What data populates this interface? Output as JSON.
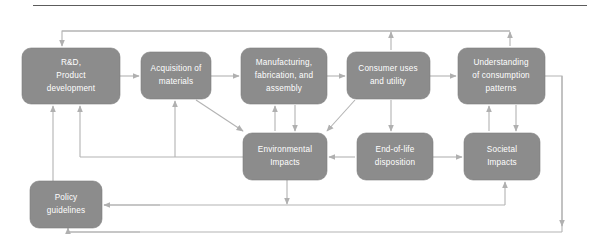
{
  "figure": {
    "type": "flow-diagram",
    "title": "",
    "top_rule": true,
    "palette": {
      "node_fill": "#8c8c8c",
      "node_text": "#ffffff",
      "edge": "#b3b3b3",
      "rule": "#5c5c5c",
      "background": "#ffffff"
    },
    "nodes": [
      {
        "id": "rd",
        "name": "rd-product-development",
        "lines": [
          "R&D,",
          "Product",
          "development"
        ],
        "x": 22,
        "y": 48,
        "w": 98,
        "h": 56
      },
      {
        "id": "acquisition",
        "name": "acquisition-of-materials",
        "lines": [
          "Acquisition of",
          "materials"
        ],
        "x": 141,
        "y": 52,
        "w": 70,
        "h": 47
      },
      {
        "id": "manufacturing",
        "name": "manufacturing-fabrication-assembly",
        "lines": [
          "Manufacturing,",
          "fabrication, and",
          "assembly"
        ],
        "x": 241,
        "y": 48,
        "w": 86,
        "h": 56
      },
      {
        "id": "consumer",
        "name": "consumer-uses-and-utility",
        "lines": [
          "Consumer uses",
          "and utility"
        ],
        "x": 347,
        "y": 52,
        "w": 83,
        "h": 47
      },
      {
        "id": "understanding",
        "name": "understanding-of-consumption-patterns",
        "lines": [
          "Understanding",
          "of consumption",
          "patterns"
        ],
        "x": 458,
        "y": 48,
        "w": 87,
        "h": 56
      },
      {
        "id": "environmental",
        "name": "environmental-impacts",
        "lines": [
          "Environmental",
          "Impacts"
        ],
        "x": 243,
        "y": 133,
        "w": 84,
        "h": 47
      },
      {
        "id": "endoflife",
        "name": "end-of-life-disposition",
        "lines": [
          "End-of-life",
          "disposition"
        ],
        "x": 357,
        "y": 133,
        "w": 76,
        "h": 47
      },
      {
        "id": "societal",
        "name": "societal-impacts",
        "lines": [
          "Societal",
          "Impacts"
        ],
        "x": 464,
        "y": 133,
        "w": 76,
        "h": 47
      },
      {
        "id": "policy",
        "name": "policy-guidelines",
        "lines": [
          "Policy",
          "guidelines"
        ],
        "x": 30,
        "y": 181,
        "w": 72,
        "h": 47
      }
    ],
    "edges": [
      {
        "name": "edge-rd-to-acquisition",
        "from": "rd",
        "to": "acquisition"
      },
      {
        "name": "edge-acquisition-to-manufacturing",
        "from": "acquisition",
        "to": "manufacturing"
      },
      {
        "name": "edge-manufacturing-to-consumer",
        "from": "manufacturing",
        "to": "consumer"
      },
      {
        "name": "edge-consumer-to-understanding",
        "from": "consumer",
        "to": "understanding"
      },
      {
        "name": "edge-acquisition-to-environmental",
        "from": "acquisition",
        "to": "environmental"
      },
      {
        "name": "edge-manufacturing-to-environmental",
        "from": "manufacturing",
        "to": "environmental"
      },
      {
        "name": "edge-consumer-to-environmental",
        "from": "consumer",
        "to": "environmental"
      },
      {
        "name": "edge-consumer-to-endoflife",
        "from": "consumer",
        "to": "endoflife"
      },
      {
        "name": "edge-endoflife-to-environmental",
        "from": "endoflife",
        "to": "environmental"
      },
      {
        "name": "edge-endoflife-to-societal",
        "from": "endoflife",
        "to": "societal"
      },
      {
        "name": "edge-understanding-to-societal",
        "from": "understanding",
        "to": "societal"
      },
      {
        "name": "edge-societal-to-understanding",
        "from": "societal",
        "to": "understanding"
      },
      {
        "name": "edge-consumer-to-rd-feedback",
        "from": "consumer",
        "to": "rd"
      },
      {
        "name": "edge-understanding-to-rd-feedback",
        "from": "understanding",
        "to": "rd"
      },
      {
        "name": "edge-environmental-to-rd-feedback",
        "from": "environmental",
        "to": "rd"
      },
      {
        "name": "edge-environmental-to-acquisition-feedback",
        "from": "environmental",
        "to": "acquisition"
      },
      {
        "name": "edge-environmental-to-manufacturing-feedback",
        "from": "environmental",
        "to": "manufacturing"
      },
      {
        "name": "edge-environmental-to-policy",
        "from": "environmental",
        "to": "policy"
      },
      {
        "name": "edge-societal-to-policy",
        "from": "societal",
        "to": "policy"
      },
      {
        "name": "edge-policy-to-rd",
        "from": "policy",
        "to": "rd"
      },
      {
        "name": "edge-understanding-to-policy-bottom",
        "from": "understanding",
        "to": "policy"
      },
      {
        "name": "edge-bottom-return-to-societal",
        "from": "policy",
        "to": "societal"
      }
    ]
  }
}
